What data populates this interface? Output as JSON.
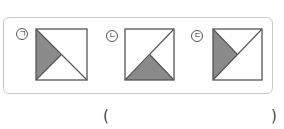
{
  "question": {
    "options": [
      {
        "label": "ㄱ",
        "shape": "square split by diagonals, left triangle shaded",
        "lines": [
          "top-left to bottom-right",
          "bottom-left to center"
        ],
        "shaded": "left"
      },
      {
        "label": "ㄴ",
        "shape": "square split by diagonals, bottom triangle shaded",
        "lines": [
          "bottom-left to top-right",
          "bottom-right to center"
        ],
        "shaded": "bottom"
      },
      {
        "label": "ㄷ",
        "shape": "square split by diagonals, left triangle shaded",
        "lines": [
          "bottom-left to top-right",
          "top-left to center"
        ],
        "shaded": "left"
      }
    ],
    "answer_open": "(",
    "answer_close": ")",
    "colors": {
      "shade": "#8a8a8a",
      "line": "#555555",
      "border": "#c9c9c9"
    }
  }
}
